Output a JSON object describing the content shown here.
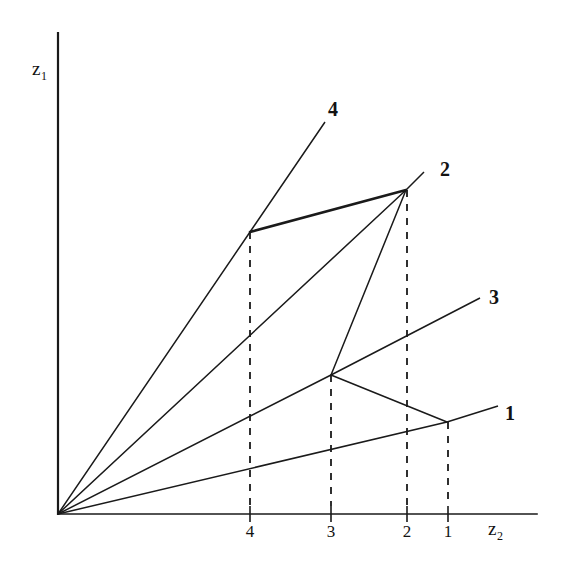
{
  "figure": {
    "background": "#ffffff",
    "ink": "#1a1a1a",
    "width": 564,
    "height": 569
  },
  "axes": {
    "y_label": "z",
    "y_label_sub": "1",
    "x_label": "z",
    "x_label_sub": "2",
    "origin": {
      "x": 58,
      "y": 514
    },
    "x_axis_end": {
      "x": 537,
      "y": 514
    },
    "y_axis_top": {
      "x": 58,
      "y": 33
    }
  },
  "x_ticks": [
    {
      "label": "4",
      "x": 250
    },
    {
      "label": "3",
      "x": 331
    },
    {
      "label": "2",
      "x": 407
    },
    {
      "label": "1",
      "x": 448
    }
  ],
  "curve_labels": [
    {
      "text": "4",
      "x": 328,
      "y": 98
    },
    {
      "text": "2",
      "x": 440,
      "y": 158
    },
    {
      "text": "3",
      "x": 489,
      "y": 286
    },
    {
      "text": "1",
      "x": 505,
      "y": 402
    }
  ],
  "chart_data": {
    "type": "line",
    "title": "",
    "xlabel": "z2",
    "ylabel": "z1",
    "grid": false,
    "legend": "inline end-of-line labels",
    "xlim": [
      0,
      5.8
    ],
    "ylim": [
      0,
      5.9
    ],
    "series": [
      {
        "name": "4",
        "stroke": "solid",
        "points_px": [
          [
            58,
            514
          ],
          [
            250,
            232
          ],
          [
            325,
            122
          ]
        ],
        "breakpoint_px": [
          250,
          232
        ],
        "breakpoint_tick": "4"
      },
      {
        "name": "2",
        "stroke": "solid",
        "points_px": [
          [
            58,
            514
          ],
          [
            406,
            190
          ],
          [
            424,
            172
          ]
        ],
        "breakpoint_px": [
          406,
          190
        ],
        "breakpoint_tick": "2"
      },
      {
        "name": "3",
        "stroke": "solid",
        "points_px": [
          [
            58,
            514
          ],
          [
            331,
            375
          ],
          [
            480,
            298
          ]
        ],
        "breakpoint_px": [
          331,
          375
        ],
        "breakpoint_tick": "3"
      },
      {
        "name": "1",
        "stroke": "solid",
        "points_px": [
          [
            58,
            514
          ],
          [
            447,
            422
          ],
          [
            498,
            406
          ]
        ],
        "breakpoint_px": [
          447,
          422
        ],
        "breakpoint_tick": "1"
      }
    ],
    "connector_segments": [
      {
        "name": "seg-4-to-2",
        "from_px": [
          250,
          232
        ],
        "to_px": [
          406,
          190
        ],
        "weight": "bold"
      },
      {
        "name": "seg-2-to-3",
        "from_px": [
          406,
          190
        ],
        "to_px": [
          331,
          375
        ],
        "weight": "normal"
      },
      {
        "name": "seg-3-to-1",
        "from_px": [
          331,
          375
        ],
        "to_px": [
          447,
          422
        ],
        "weight": "normal"
      }
    ],
    "drop_lines": [
      {
        "tick": "4",
        "x": 250,
        "y_top": 232,
        "y_bottom": 506
      },
      {
        "tick": "3",
        "x": 331,
        "y_top": 375,
        "y_bottom": 506
      },
      {
        "tick": "2",
        "x": 407,
        "y_top": 190,
        "y_bottom": 506
      },
      {
        "tick": "1",
        "x": 448,
        "y_top": 422,
        "y_bottom": 506
      }
    ]
  }
}
